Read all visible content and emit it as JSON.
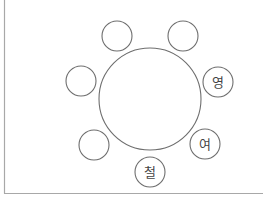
{
  "diagram": {
    "table": {
      "label": ""
    },
    "seats": [
      {
        "position": "top-left",
        "label": ""
      },
      {
        "position": "top-right",
        "label": ""
      },
      {
        "position": "right",
        "label": "영"
      },
      {
        "position": "lower-right",
        "label": "여"
      },
      {
        "position": "bottom",
        "label": "철"
      },
      {
        "position": "lower-left",
        "label": ""
      },
      {
        "position": "left",
        "label": ""
      }
    ],
    "colors": {
      "stroke": "#6e6e6e",
      "border": "#a8a8a8",
      "text": "#444444"
    }
  }
}
